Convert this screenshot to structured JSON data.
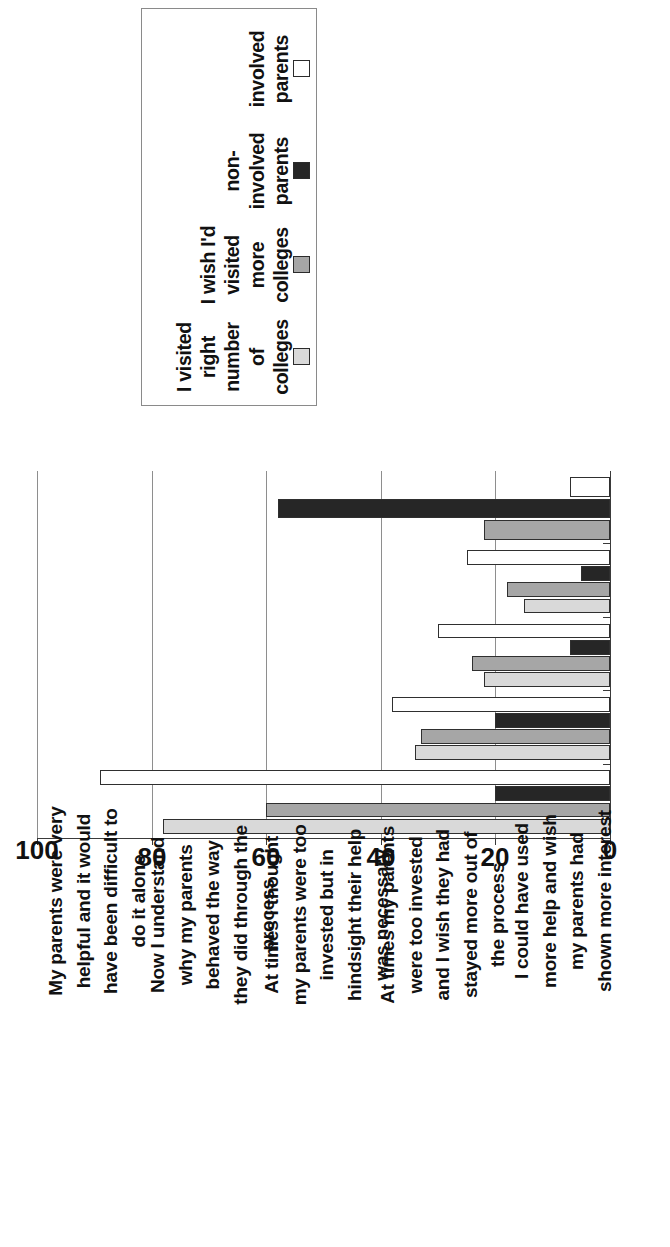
{
  "legend": {
    "title": "",
    "items": [
      {
        "label": "I visited right number of colleges",
        "color": "#d9d9d9",
        "name": "visited-right-number"
      },
      {
        "label": "I wish I'd visited more colleges",
        "color": "#a6a6a6",
        "name": "wish-visited-more"
      },
      {
        "label": "non-involved parents",
        "color": "#262626",
        "name": "non-involved-parents"
      },
      {
        "label": "involved parents",
        "color": "#ffffff",
        "name": "involved-parents"
      }
    ]
  },
  "axis": {
    "ticks": [
      "0",
      "20",
      "40",
      "60",
      "80",
      "100"
    ],
    "min": 0,
    "max": 100,
    "step": 20
  },
  "chart_data": {
    "type": "bar",
    "title": "",
    "xlabel": "",
    "ylabel": "",
    "ylim": [
      0,
      100
    ],
    "grid": true,
    "legend_position": "top",
    "orientation": "rotated-90",
    "categories": [
      "My parents were very helpful and it would have been difficult to do it alone",
      "Now I understand why my parents behaved the way they did through the process",
      "At times I thought my parents were too invested but in hindsight their help was necessary",
      "At times my parents were too invested and I wish they had stayed more out of the process",
      "I could have used more help and wish my parents had shown more interest"
    ],
    "series": [
      {
        "name": "I visited right number of colleges",
        "color": "#d9d9d9",
        "values": [
          78,
          34,
          22,
          15,
          null
        ]
      },
      {
        "name": "I wish I'd visited more colleges",
        "color": "#a6a6a6",
        "values": [
          60,
          33,
          24,
          18,
          22
        ]
      },
      {
        "name": "non-involved parents",
        "color": "#262626",
        "values": [
          20,
          20,
          7,
          5,
          58
        ]
      },
      {
        "name": "involved parents",
        "color": "#ffffff",
        "values": [
          89,
          38,
          30,
          25,
          7
        ]
      }
    ]
  }
}
